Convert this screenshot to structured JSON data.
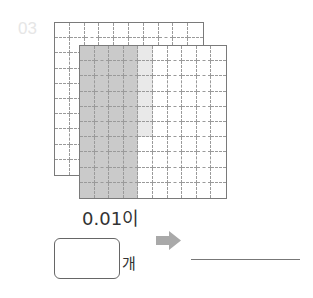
{
  "problem": {
    "number": "03",
    "grids": {
      "rows": 10,
      "cols": 10,
      "back": {
        "shaded_dark": [],
        "shaded_light": []
      },
      "front": {
        "dark_columns": [
          0,
          1,
          2,
          3
        ],
        "light_cells": [
          [
            0,
            4
          ],
          [
            1,
            4
          ],
          [
            2,
            4
          ],
          [
            3,
            4
          ],
          [
            4,
            4
          ],
          [
            5,
            4
          ]
        ]
      }
    },
    "colors": {
      "dark_shade": "#cacaca",
      "light_shade": "#e9e9e9",
      "arrow": "#a9a9a9"
    },
    "label": "0.01이",
    "answer_box_value": "",
    "unit": "개",
    "arrow_icon": "right-arrow-icon",
    "answer_line_value": ""
  }
}
